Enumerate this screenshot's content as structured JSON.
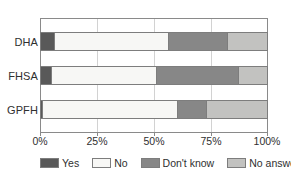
{
  "chart_data": {
    "type": "bar",
    "orientation": "horizontal",
    "stacked": true,
    "normalized": "percent",
    "title": "",
    "subtitle": "",
    "xlabel": "",
    "ylabel": "",
    "xlim": [
      0,
      100
    ],
    "grid": true,
    "legend_position": "bottom",
    "categories": [
      "DHA",
      "FHSA",
      "GPFH"
    ],
    "xticks": [
      "0%",
      "25%",
      "50%",
      "75%",
      "100%"
    ],
    "xtick_values": [
      0,
      25,
      50,
      75,
      100
    ],
    "series": [
      {
        "name": "Yes",
        "color": "#595959",
        "values": [
          6,
          5,
          1
        ]
      },
      {
        "name": "No",
        "color": "#f7f7f5",
        "values": [
          50,
          46,
          59
        ]
      },
      {
        "name": "Don't know",
        "color": "#878787",
        "values": [
          26,
          36,
          13
        ]
      },
      {
        "name": "No answer",
        "color": "#c2c2c0",
        "values": [
          18,
          13,
          27
        ]
      }
    ]
  },
  "legend": {
    "items": [
      {
        "label": "Yes",
        "color": "#595959"
      },
      {
        "label": "No",
        "color": "#f7f7f5"
      },
      {
        "label": "Don't know",
        "color": "#878787"
      },
      {
        "label": "No answer",
        "color": "#c2c2c0"
      }
    ]
  },
  "colors": {
    "yes": "#595959",
    "no": "#f7f7f5",
    "dont_know": "#878787",
    "no_answer": "#c2c2c0",
    "axis": "#8a8a8a",
    "grid": "#d2d2d2",
    "text": "#2f2f2f",
    "background": "#ffffff"
  }
}
